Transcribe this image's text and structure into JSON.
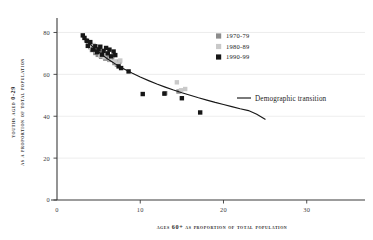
{
  "chart_data": {
    "type": "scatter",
    "title": "",
    "xlabel": "Ages 60+ as proportion of total population",
    "ylabel_line1": "Youths aged 0-29",
    "ylabel_line2": "as a proportion of total population",
    "xlim": [
      0,
      37
    ],
    "ylim": [
      0,
      85
    ],
    "xticks": [
      0,
      10,
      20,
      30
    ],
    "yticks": [
      0,
      20,
      40,
      60,
      80
    ],
    "xtick_labels": [
      "0",
      "10",
      "20",
      "30"
    ],
    "ytick_labels": [
      "0",
      "20",
      "40",
      "60",
      "80"
    ],
    "grid": "horizontal-faint",
    "legend_position": "upper-right",
    "marker": "square",
    "series": [
      {
        "name": "1970-79",
        "color": "#8c8c8c",
        "points": [
          [
            3.5,
            76.2
          ],
          [
            3.8,
            74.5
          ],
          [
            4.0,
            73.0
          ],
          [
            4.2,
            71.6
          ],
          [
            4.5,
            72.4
          ],
          [
            4.6,
            70.2
          ],
          [
            4.9,
            69.3
          ],
          [
            5.1,
            70.8
          ],
          [
            5.3,
            68.4
          ],
          [
            5.6,
            69.6
          ],
          [
            5.8,
            67.5
          ],
          [
            6.0,
            68.8
          ],
          [
            6.3,
            66.9
          ],
          [
            6.6,
            67.8
          ],
          [
            6.9,
            65.4
          ],
          [
            7.2,
            64.6
          ],
          [
            7.5,
            66.1
          ],
          [
            13.0,
            51.0
          ],
          [
            14.6,
            51.8
          ]
        ]
      },
      {
        "name": "1980-89",
        "color": "#c9c9c9",
        "points": [
          [
            3.9,
            75.0
          ],
          [
            4.1,
            72.8
          ],
          [
            4.4,
            74.0
          ],
          [
            4.7,
            71.0
          ],
          [
            5.0,
            72.0
          ],
          [
            5.2,
            69.0
          ],
          [
            5.5,
            70.4
          ],
          [
            5.7,
            68.2
          ],
          [
            6.1,
            69.8
          ],
          [
            6.4,
            67.2
          ],
          [
            6.7,
            68.6
          ],
          [
            7.0,
            66.2
          ],
          [
            7.3,
            65.0
          ],
          [
            7.6,
            66.6
          ],
          [
            14.4,
            56.2
          ],
          [
            15.4,
            53.0
          ],
          [
            14.9,
            52.4
          ]
        ]
      },
      {
        "name": "1990-99",
        "color": "#161616",
        "points": [
          [
            3.1,
            78.6
          ],
          [
            3.3,
            77.4
          ],
          [
            3.6,
            76.0
          ],
          [
            3.7,
            73.6
          ],
          [
            4.0,
            75.4
          ],
          [
            4.3,
            71.8
          ],
          [
            4.6,
            73.4
          ],
          [
            4.8,
            70.6
          ],
          [
            5.0,
            71.9
          ],
          [
            5.2,
            73.2
          ],
          [
            5.4,
            69.4
          ],
          [
            5.6,
            71.2
          ],
          [
            5.9,
            72.6
          ],
          [
            6.1,
            70.0
          ],
          [
            6.3,
            71.8
          ],
          [
            6.5,
            68.6
          ],
          [
            6.8,
            70.9
          ],
          [
            7.0,
            69.2
          ],
          [
            7.4,
            63.8
          ],
          [
            7.7,
            63.0
          ],
          [
            8.6,
            61.4
          ],
          [
            10.3,
            50.6
          ],
          [
            12.9,
            50.8
          ],
          [
            15.0,
            48.6
          ],
          [
            17.2,
            41.8
          ]
        ]
      }
    ],
    "fit_curve": {
      "name": "Demographic transition",
      "color": "#171717",
      "points": [
        [
          3.0,
          79.0
        ],
        [
          3.5,
          76.5
        ],
        [
          4.0,
          74.3
        ],
        [
          4.5,
          72.4
        ],
        [
          5.0,
          70.7
        ],
        [
          5.5,
          69.1
        ],
        [
          6.0,
          67.6
        ],
        [
          6.5,
          66.3
        ],
        [
          7.0,
          65.0
        ],
        [
          7.5,
          63.8
        ],
        [
          8.0,
          62.7
        ],
        [
          9.0,
          60.6
        ],
        [
          10.0,
          58.7
        ],
        [
          11.0,
          57.0
        ],
        [
          12.0,
          55.4
        ],
        [
          13.0,
          53.9
        ],
        [
          14.0,
          52.5
        ],
        [
          15.0,
          51.2
        ],
        [
          16.0,
          50.0
        ],
        [
          17.0,
          48.8
        ],
        [
          18.0,
          47.7
        ],
        [
          19.0,
          46.6
        ],
        [
          20.0,
          45.6
        ],
        [
          21.0,
          44.6
        ],
        [
          22.0,
          43.6
        ],
        [
          23.0,
          42.7
        ],
        [
          24.0,
          41.0
        ],
        [
          25.0,
          38.6
        ]
      ]
    }
  },
  "legend": {
    "items": [
      {
        "label": "1970-79"
      },
      {
        "label": "1980-89"
      },
      {
        "label": "1990-99"
      }
    ],
    "line_entry": {
      "label": "Demographic transition"
    }
  }
}
